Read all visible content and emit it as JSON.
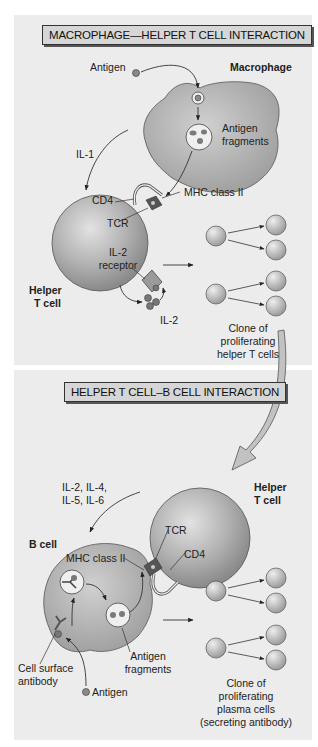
{
  "top_panel": {
    "title": "MACROPHAGE—HELPER T CELL INTERACTION",
    "labels": {
      "antigen": "Antigen",
      "macrophage": "Macrophage",
      "antigen_fragments_1": "Antigen",
      "antigen_fragments_2": "fragments",
      "il1": "IL-1",
      "mhc": "MHC class II",
      "cd4": "CD4",
      "tcr": "TCR",
      "il2_receptor_1": "IL-2",
      "il2_receptor_2": "receptor",
      "helper_t_cell_1": "Helper",
      "helper_t_cell_2": "T cell",
      "il2": "IL-2",
      "clone_1": "Clone of",
      "clone_2": "proliferating",
      "clone_3": "helper T cells"
    }
  },
  "bottom_panel": {
    "title": "HELPER T CELL–B CELL INTERACTION",
    "labels": {
      "cytokines_1": "IL-2, IL-4,",
      "cytokines_2": "IL-5, IL-6",
      "helper_t_cell_1": "Helper",
      "helper_t_cell_2": "T cell",
      "b_cell": "B cell",
      "mhc": "MHC class II",
      "tcr": "TCR",
      "cd4": "CD4",
      "antigen_fragments_1": "Antigen",
      "antigen_fragments_2": "fragments",
      "cell_surface_antibody_1": "Cell surface",
      "cell_surface_antibody_2": "antibody",
      "antigen": "Antigen",
      "clone_1": "Clone of",
      "clone_2": "proliferating",
      "clone_3": "plasma cells",
      "clone_4": "(secreting antibody)"
    }
  },
  "colors": {
    "panel_bg": "#ececec",
    "cell_fill": "#b4b4b4",
    "cell_dark": "#8e8e8e",
    "title_bg": "#d6d6d6"
  }
}
